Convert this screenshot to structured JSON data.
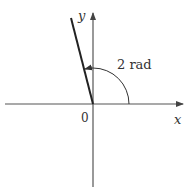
{
  "diagram": {
    "type": "angle-in-standard-position",
    "axes": {
      "x_label": "x",
      "y_label": "y",
      "origin_label": "0"
    },
    "angle": {
      "label": "2 rad",
      "value_radians": 2,
      "direction": "counterclockwise"
    },
    "colors": {
      "axis": "#555555",
      "terminal_side": "#222222",
      "text": "#333333",
      "background": "#ffffff"
    }
  }
}
